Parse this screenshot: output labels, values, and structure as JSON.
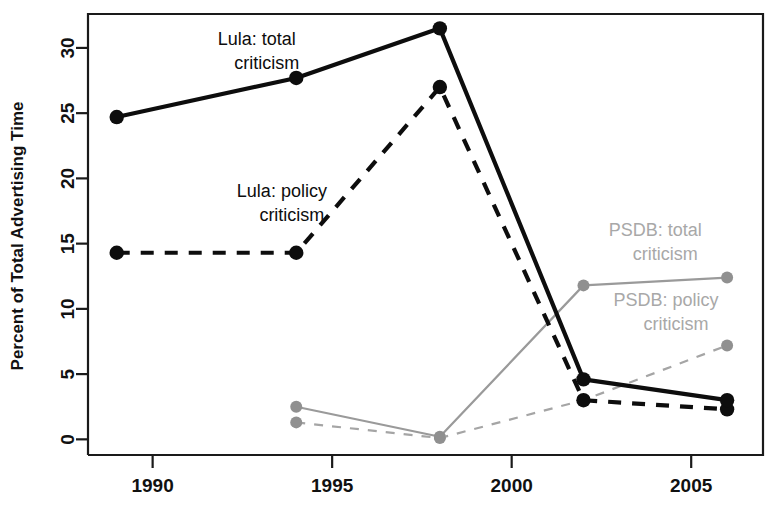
{
  "chart_data": {
    "type": "line",
    "title": "",
    "xlabel": "",
    "ylabel": "Percent of Total Advertising Time",
    "xlim": [
      1988.2,
      2007.0
    ],
    "ylim": [
      -1.2,
      32.6
    ],
    "xticks": [
      1990,
      1995,
      2000,
      2005
    ],
    "xtick_labels": [
      "1990",
      "1995",
      "2000",
      "2005"
    ],
    "yticks": [
      0,
      5,
      10,
      15,
      20,
      25,
      30
    ],
    "ytick_labels": [
      "0",
      "5",
      "10",
      "15",
      "20",
      "25",
      "30"
    ],
    "grid": false,
    "legend": "inline annotations",
    "series": [
      {
        "name": "Lula: total criticism",
        "color": "#0d0d0d",
        "style": "solid",
        "marker": "filled-circle",
        "x": [
          1989,
          1994,
          1998,
          2002,
          2006
        ],
        "values": [
          24.7,
          27.7,
          31.5,
          4.6,
          3.0
        ]
      },
      {
        "name": "Lula: policy criticism",
        "color": "#0d0d0d",
        "style": "dashed",
        "marker": "filled-circle",
        "x": [
          1989,
          1994,
          1998,
          2002,
          2006
        ],
        "values": [
          14.3,
          14.3,
          27.0,
          3.0,
          2.3
        ]
      },
      {
        "name": "PSDB: total criticism",
        "color": "#909090",
        "style": "solid",
        "marker": "filled-circle",
        "x": [
          1994,
          1998,
          2002,
          2006
        ],
        "values": [
          2.5,
          0.2,
          11.8,
          12.4
        ]
      },
      {
        "name": "PSDB: policy criticism",
        "color": "#a5a5a5",
        "style": "dashed",
        "marker": "filled-circle",
        "x": [
          1994,
          1998,
          2002,
          2006
        ],
        "values": [
          1.3,
          0.1,
          3.0,
          7.2
        ]
      }
    ],
    "annotations": [
      {
        "text_line1": "Lula: total",
        "text_line2": "criticism",
        "color": "#0d0d0d",
        "x": 1992.9,
        "y": 30.2
      },
      {
        "text_line1": "Lula: policy",
        "text_line2": "criticism",
        "color": "#0d0d0d",
        "x": 1993.6,
        "y": 18.6
      },
      {
        "text_line1": "PSDB: total",
        "text_line2": "criticism",
        "color": "#a8a8a8",
        "x": 2004.0,
        "y": 15.6
      },
      {
        "text_line1": "PSDB: policy",
        "text_line2": "criticism",
        "color": "#a8a8a8",
        "x": 2004.3,
        "y": 10.2
      }
    ]
  }
}
